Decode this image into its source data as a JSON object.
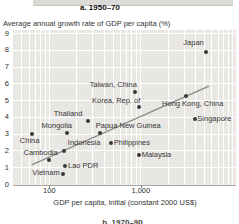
{
  "figure": {
    "panel_title": "a. 1950–70",
    "y_axis_title": "Average annual growth rate of GDP per capita (%)",
    "x_axis_title": "GDP per capita, initial (constant 2000 US$)",
    "next_panel_title": "b. 1970–90"
  },
  "chart_data": {
    "type": "scatter",
    "title": "a. 1950–70",
    "xlabel": "GDP per capita, initial (constant 2000 US$)",
    "ylabel": "Average annual growth rate of GDP per capita (%)",
    "x_scale": "log",
    "xlim": [
      40,
      11000
    ],
    "ylim": [
      0,
      9.25
    ],
    "grid": true,
    "x_tick_values": [
      100,
      1000
    ],
    "x_tick_labels": [
      "100",
      "1,000"
    ],
    "y_tick_values": [
      0,
      1,
      2,
      3,
      4,
      5,
      6,
      7,
      8,
      9
    ],
    "x_minor_gridlines": [
      50,
      60,
      70,
      80,
      90,
      100,
      200,
      300,
      400,
      500,
      600,
      700,
      800,
      900,
      1000,
      2000,
      3000,
      4000,
      5000,
      6000,
      7000,
      8000,
      9000,
      10000
    ],
    "points": [
      {
        "name": "Japan",
        "x": 5200,
        "y": 7.9,
        "label": {
          "side": "left",
          "dx": -2.5,
          "dy": -9
        }
      },
      {
        "name": "Taiwan, China",
        "x": 870,
        "y": 5.5,
        "label": {
          "side": "above",
          "dx": -22,
          "dy": -3
        }
      },
      {
        "name": "Korea, Rep. of",
        "x": 960,
        "y": 4.6,
        "label": {
          "side": "above",
          "dx": -23,
          "dy": -2.5
        }
      },
      {
        "name": "Hong Kong, China",
        "x": 3100,
        "y": 5.3,
        "label": {
          "side": "below",
          "dx": 7,
          "dy": 4.5
        }
      },
      {
        "name": "Singapore",
        "x": 3900,
        "y": 3.9,
        "label": {
          "side": "right",
          "dx": 2.5,
          "dy": 0
        }
      },
      {
        "name": "Thailand",
        "x": 265,
        "y": 3.8,
        "label": {
          "side": "above",
          "dx": -20,
          "dy": -3
        }
      },
      {
        "name": "Mongolia",
        "x": 155,
        "y": 3.1,
        "label": {
          "side": "above",
          "dx": -10,
          "dy": -3
        }
      },
      {
        "name": "Papua New Guinea",
        "x": 360,
        "y": 3.05,
        "label": {
          "side": "above",
          "dx": 28,
          "dy": -3
        }
      },
      {
        "name": "Philippines",
        "x": 475,
        "y": 2.45,
        "label": {
          "side": "right",
          "dx": 2.5,
          "dy": -0.5
        }
      },
      {
        "name": "Indonesia",
        "x": 145,
        "y": 2.0,
        "label": {
          "side": "above",
          "dx": 20,
          "dy": -3.5
        }
      },
      {
        "name": "China",
        "x": 64,
        "y": 3.0,
        "label": {
          "side": "below",
          "dx": -2,
          "dy": 2.5
        }
      },
      {
        "name": "Cambodia",
        "x": 98,
        "y": 1.45,
        "label": {
          "side": "above",
          "dx": -8,
          "dy": -3
        }
      },
      {
        "name": "Lao PDR",
        "x": 150,
        "y": 1.1,
        "label": {
          "side": "right",
          "dx": 2.5,
          "dy": 0
        }
      },
      {
        "name": "Vietnam",
        "x": 140,
        "y": 0.6,
        "label": {
          "side": "left",
          "dx": -3,
          "dy": -1
        }
      },
      {
        "name": "Malaysia",
        "x": 960,
        "y": 1.75,
        "label": {
          "side": "right",
          "dx": 2.5,
          "dy": -0.5
        }
      }
    ],
    "trend_line": {
      "x1": 64,
      "y1": 1.2,
      "x2": 5560,
      "y2": 5.9
    },
    "colors": {
      "plot_bg": "#e9e7e3",
      "gridline": "#ffffff",
      "dot": "#383838",
      "trend": "#8e8c89",
      "text": "#333333"
    }
  }
}
